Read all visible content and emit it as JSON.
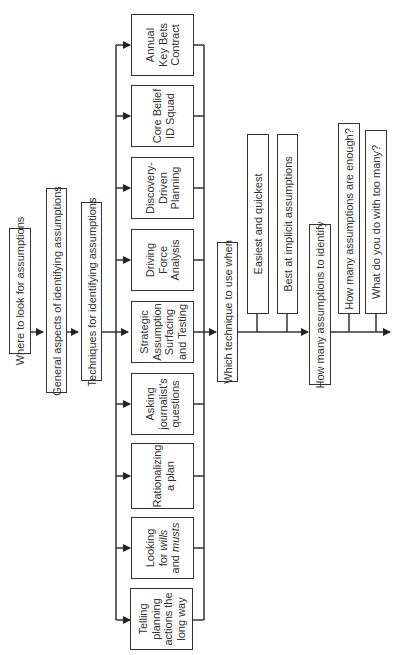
{
  "main_flow": [
    {
      "id": "where",
      "label": "Where to look for assumptions"
    },
    {
      "id": "general",
      "label": "General aspects of identifying assumptions"
    },
    {
      "id": "techniques",
      "label": "Techniques for identifying assumptions"
    },
    {
      "id": "which",
      "label": "Which technique to use when"
    },
    {
      "id": "howmany",
      "label": "How many assumptions to identify"
    }
  ],
  "techniques": [
    {
      "id": "annual",
      "lines": [
        "Annual",
        "Key Bets",
        "Contract"
      ]
    },
    {
      "id": "core",
      "lines": [
        "Core Belief",
        "ID Squad"
      ]
    },
    {
      "id": "discovery",
      "lines": [
        "Discovery-",
        "Driven",
        "Planning"
      ]
    },
    {
      "id": "driving",
      "lines": [
        "Driving",
        "Force",
        "Analysis"
      ]
    },
    {
      "id": "strategic",
      "lines": [
        "Strategic",
        "Assumption",
        "Surfacing",
        "and Testing"
      ]
    },
    {
      "id": "asking",
      "lines": [
        "Asking",
        "journalist's",
        "questions"
      ]
    },
    {
      "id": "rationalizing",
      "lines": [
        "Rationalizing",
        "a plan"
      ]
    },
    {
      "id": "looking",
      "lines": [
        "Looking",
        "for wills",
        "and musts"
      ]
    },
    {
      "id": "telling",
      "lines": [
        "Telling",
        "planning",
        "actions the",
        "long way"
      ]
    }
  ],
  "which_branches": [
    {
      "id": "easiest",
      "label": "Easiest and quickest"
    },
    {
      "id": "best",
      "label": "Best at implicit assumptions"
    }
  ],
  "howmany_branches": [
    {
      "id": "enough",
      "label": "How many assumptions are enough?"
    },
    {
      "id": "toomany",
      "label": "What do you do with too many?"
    }
  ]
}
